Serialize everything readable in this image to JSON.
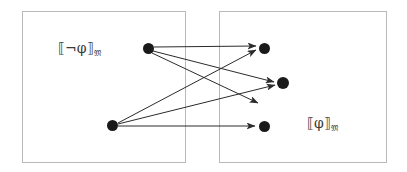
{
  "figure": {
    "background_color": "#ffffff",
    "box_border_color": "#b9b9b9",
    "edge_color": "#2b2b2b",
    "node_color": "#1a1a1a",
    "width": 407,
    "height": 172
  },
  "regions": [
    {
      "id": "left-region",
      "label_prefix": "⟦¬φ⟧",
      "label_subscript": "𝔐",
      "label_full": "⟦¬φ⟧𝔐",
      "x": 22,
      "y": 11,
      "width": 164,
      "height": 152
    },
    {
      "id": "right-region",
      "label_prefix": "⟦φ⟧",
      "label_subscript": "𝔐",
      "label_full": "⟦φ⟧𝔐",
      "x": 219,
      "y": 11,
      "width": 168,
      "height": 152
    }
  ],
  "nodes": [
    {
      "id": "n-left-top",
      "side": "left",
      "x": 148,
      "y": 48,
      "r": 5.5
    },
    {
      "id": "n-left-bottom",
      "side": "left",
      "x": 112,
      "y": 125,
      "r": 5.5
    },
    {
      "id": "n-right-top",
      "side": "right",
      "x": 264,
      "y": 48,
      "r": 5.5
    },
    {
      "id": "n-right-middle",
      "side": "right",
      "x": 283,
      "y": 83,
      "r": 6.0
    },
    {
      "id": "n-right-bottom",
      "side": "right",
      "x": 264,
      "y": 126,
      "r": 5.5
    }
  ],
  "edges": [
    {
      "id": "e1",
      "from": "n-left-top",
      "to": "n-right-top",
      "x1": 154,
      "y1": 47,
      "x2": 256,
      "y2": 46
    },
    {
      "id": "e2",
      "from": "n-left-top",
      "to": "n-right-middle",
      "x1": 153,
      "y1": 51,
      "x2": 274,
      "y2": 82
    },
    {
      "id": "e3",
      "from": "n-left-top",
      "to": "dangling-arrow",
      "x1": 152,
      "y1": 53,
      "x2": 258,
      "y2": 103
    },
    {
      "id": "e4",
      "from": "n-left-bottom",
      "to": "n-right-top",
      "x1": 118,
      "y1": 123,
      "x2": 256,
      "y2": 50
    },
    {
      "id": "e5",
      "from": "n-left-bottom",
      "to": "n-right-middle",
      "x1": 118,
      "y1": 124,
      "x2": 275,
      "y2": 85
    },
    {
      "id": "e6",
      "from": "n-left-bottom",
      "to": "n-right-bottom",
      "x1": 118,
      "y1": 126,
      "x2": 255,
      "y2": 126
    }
  ]
}
